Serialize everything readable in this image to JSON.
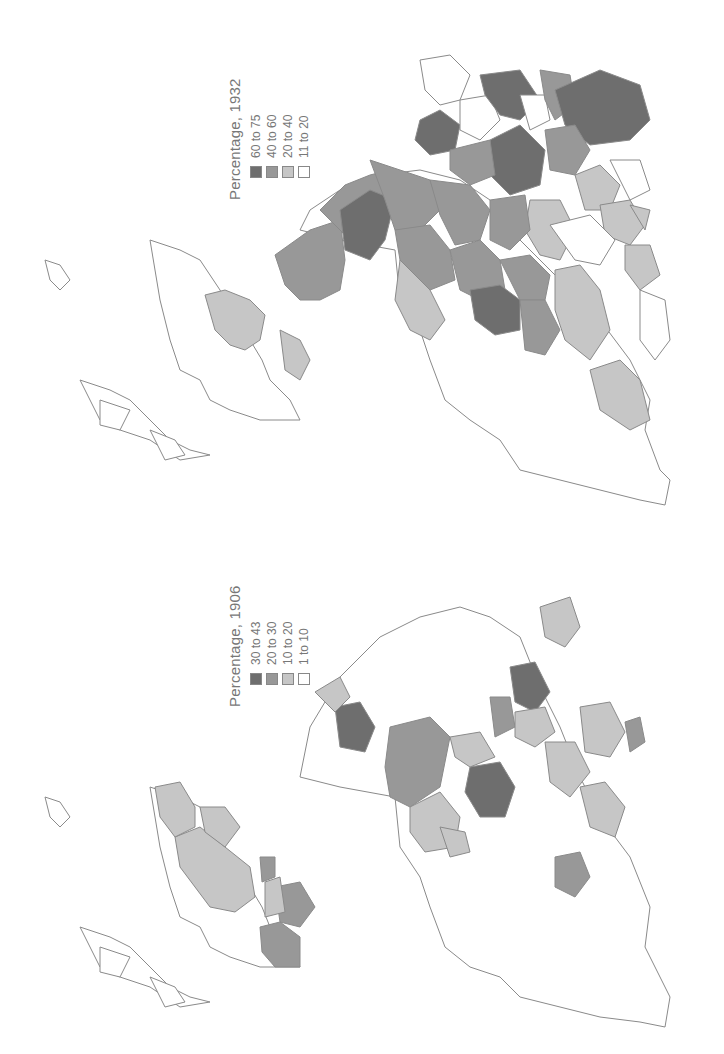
{
  "figure": {
    "orientation": "rotated 90 degrees counter-clockwise",
    "stroke_color": "#8a8a8a"
  },
  "maps": [
    {
      "id": "map-1932",
      "legend": {
        "title": "Percentage, 1932",
        "classes": [
          {
            "label": "60 to 75",
            "color": "#6e6e6e"
          },
          {
            "label": "40 to 60",
            "color": "#989898"
          },
          {
            "label": "20 to 40",
            "color": "#c6c6c6"
          },
          {
            "label": "11 to 20",
            "color": "#ffffff"
          }
        ]
      }
    },
    {
      "id": "map-1906",
      "legend": {
        "title": "Percentage, 1906",
        "classes": [
          {
            "label": "30 to 43",
            "color": "#6e6e6e"
          },
          {
            "label": "20 to 30",
            "color": "#989898"
          },
          {
            "label": "10 to 20",
            "color": "#c6c6c6"
          },
          {
            "label": "1 to 10",
            "color": "#ffffff"
          }
        ]
      }
    }
  ]
}
